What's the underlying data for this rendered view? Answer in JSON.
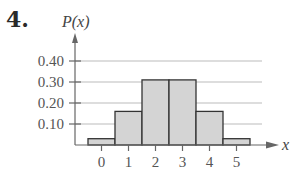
{
  "problem_number": "4.",
  "chart_data": {
    "type": "bar",
    "title": "",
    "xlabel": "x",
    "ylabel": "P(x)",
    "categories": [
      "0",
      "1",
      "2",
      "3",
      "4",
      "5"
    ],
    "values": [
      0.03,
      0.16,
      0.31,
      0.31,
      0.16,
      0.03
    ],
    "ylim": [
      0,
      0.45
    ],
    "yticks": [
      "0.10",
      "0.20",
      "0.30",
      "0.40"
    ],
    "ytick_values": [
      0.1,
      0.2,
      0.3,
      0.4
    ],
    "grid": true,
    "legend": null,
    "bar_color": "#d4d4d4",
    "bar_edge_color": "#333333",
    "grid_color": "#aaaaaa"
  }
}
